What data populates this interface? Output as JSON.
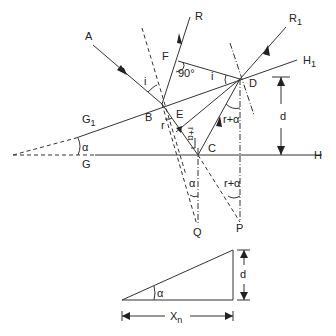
{
  "figure": {
    "type": "ray-diagram"
  },
  "labels": {
    "A": "A",
    "R": "R",
    "R1": "R",
    "R1_sub": "1",
    "H1": "H",
    "H1_sub": "1",
    "H": "H",
    "G1": "G",
    "G1_sub": "1",
    "G": "G",
    "F": "F",
    "B": "B",
    "E": "E",
    "C": "C",
    "D": "D",
    "Q": "Q",
    "P": "P",
    "d": "d"
  },
  "angles": {
    "i_at_B": "i",
    "i_at_D": "i",
    "right_angle_F": "90°",
    "r_at_B": "r",
    "alpha_wedge": "α",
    "r_plus_alpha_E": "r+α",
    "r_plus_alpha_D": "r+α",
    "alpha_Q": "α",
    "r_plus_alpha_P": "r+α"
  },
  "inset": {
    "angle": "α",
    "height_label": "d",
    "base_label": "X",
    "base_sub": "n"
  }
}
